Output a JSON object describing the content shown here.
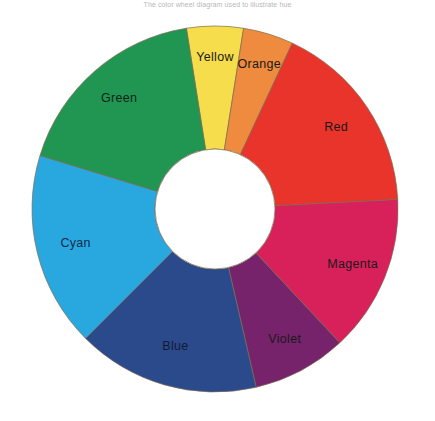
{
  "caption": {
    "text": "The color wheel diagram used to illustrate hue"
  },
  "wheel": {
    "name": "color-wheel",
    "center_x": 215,
    "center_y": 195,
    "outer_radius": 183,
    "inner_radius": 60,
    "outline_color": "#7a6a52",
    "hole_color": "#ffffff"
  },
  "chart_data": {
    "type": "pie",
    "title": "Color Wheel",
    "xlabel": "",
    "ylabel": "",
    "legend_position": "none",
    "grid": false,
    "categories": [
      "Yellow",
      "Orange",
      "Red",
      "Magenta",
      "Violet",
      "Blue",
      "Cyan",
      "Green"
    ],
    "values": [
      18,
      16,
      62,
      50,
      30,
      58,
      62,
      64
    ],
    "colors": [
      "#f5dd4b",
      "#ef8b3f",
      "#e8342a",
      "#d8215a",
      "#76236b",
      "#2b4a8b",
      "#29a8e0",
      "#219653"
    ],
    "label_colors": [
      "#1a1a1a",
      "#1a1a1a",
      "#1a1a1a",
      "#1a1a1a",
      "#1a1a1a",
      "#101a35",
      "#102a4a",
      "#0d2318"
    ],
    "start_angle_deg": -9,
    "segments": [
      {
        "label": "Yellow",
        "color": "#f5dd4b",
        "start": -9,
        "sweep": 18,
        "label_color": "#1a1a1a",
        "label_radius_frac": 0.74
      },
      {
        "label": "Orange",
        "color": "#ef8b3f",
        "start": 9,
        "sweep": 16,
        "label_color": "#1a1a1a",
        "label_radius_frac": 0.74
      },
      {
        "label": "Red",
        "color": "#e8342a",
        "start": 25,
        "sweep": 62,
        "label_color": "#1a1a1a",
        "label_radius_frac": 0.7
      },
      {
        "label": "Magenta",
        "color": "#d8215a",
        "start": 87,
        "sweep": 50,
        "label_color": "#1a1a1a",
        "label_radius_frac": 0.72
      },
      {
        "label": "Violet",
        "color": "#76236b",
        "start": 137,
        "sweep": 30,
        "label_color": "#1a1a1a",
        "label_radius_frac": 0.72
      },
      {
        "label": "Blue",
        "color": "#2b4a8b",
        "start": 167,
        "sweep": 58,
        "label_color": "#101a35",
        "label_radius_frac": 0.68
      },
      {
        "label": "Cyan",
        "color": "#29a8e0",
        "start": 225,
        "sweep": 62,
        "label_color": "#102a4a",
        "label_radius_frac": 0.68
      },
      {
        "label": "Green",
        "color": "#219653",
        "start": 287,
        "sweep": 64,
        "label_color": "#0d2318",
        "label_radius_frac": 0.7
      }
    ]
  }
}
